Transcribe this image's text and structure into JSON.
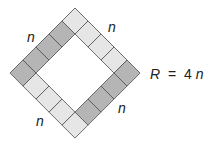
{
  "figure": {
    "type": "diamond ring of squares",
    "cells_per_side": 4,
    "colors": {
      "dark": "#b5b5b5",
      "light": "#e6e6e6",
      "stroke": "#555555"
    },
    "side_labels": [
      "n",
      "n",
      "n",
      "n"
    ],
    "equation": {
      "lhs": "R",
      "op": "=",
      "rhs_coef": "4",
      "rhs_var": "n"
    }
  }
}
